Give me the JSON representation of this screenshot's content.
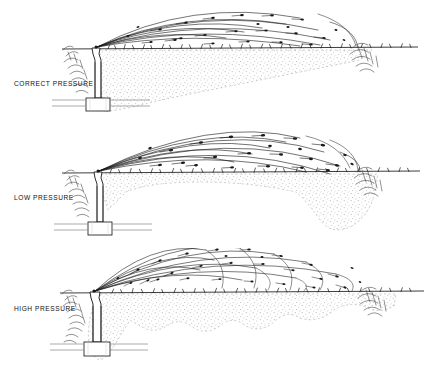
{
  "figure": {
    "background_color": "#ffffff",
    "ink_color": "#1a1a1a",
    "soil_stipple_color": "#b9b9b9"
  },
  "panels": [
    {
      "id": "correct-pressure",
      "label": "CORRECT PRESSURE",
      "order": 1,
      "spray": {
        "description": "Even low-arcing jet breaking into uniformly spaced droplets across the full radius",
        "arc_count": 9,
        "droplet_count": 34,
        "reach_ratio": 0.86,
        "peak_height_ratio": 0.72
      },
      "wetting": {
        "pattern": "uniform-wedge",
        "description": "Smooth evenly tapering wetted profile, deepest at the head and thinning to the edge"
      },
      "features": [
        "riser",
        "thrust-block",
        "lateral-pipe",
        "near-shrub",
        "far-shrub",
        "turf-line"
      ]
    },
    {
      "id": "low-pressure",
      "label": "LOW PRESSURE",
      "order": 2,
      "spray": {
        "description": "Coarse heavy droplets carried in a tight high arc that dumps water at the outer edge",
        "arc_count": 10,
        "droplet_count": 30,
        "reach_ratio": 0.84,
        "peak_height_ratio": 0.78
      },
      "wetting": {
        "pattern": "donut",
        "description": "Shallow starved band near the sprinkler with a deep saturated lobe at the perimeter"
      },
      "features": [
        "riser",
        "thrust-block",
        "lateral-pipe",
        "near-shrub",
        "far-shrub",
        "turf-line"
      ]
    },
    {
      "id": "high-pressure",
      "label": "HIGH PRESSURE",
      "order": 3,
      "spray": {
        "description": "Over-atomised mist thrown steeply upward, fine droplets falling in irregular bands",
        "arc_count": 13,
        "droplet_count": 38,
        "reach_ratio": 0.92,
        "peak_height_ratio": 0.84
      },
      "wetting": {
        "pattern": "scalloped",
        "description": "Wavy uneven wetting front with alternating deep pockets and dry scallops"
      },
      "features": [
        "riser",
        "thrust-block",
        "lateral-pipe",
        "near-shrub",
        "far-shrub",
        "turf-line"
      ]
    }
  ]
}
